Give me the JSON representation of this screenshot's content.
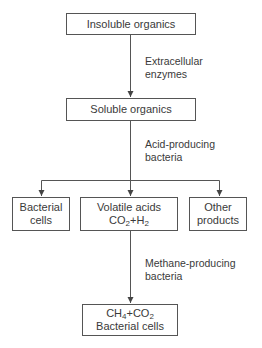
{
  "diagram": {
    "nodes": {
      "insoluble": {
        "label": "Insoluble organics"
      },
      "soluble": {
        "label": "Soluble organics"
      },
      "bacterial_cells": {
        "line1": "Bacterial",
        "line2": "cells"
      },
      "volatile": {
        "line1": "Volatile acids",
        "line2_a": "CO",
        "line2_sub_a": "2",
        "line2_b": "+H",
        "line2_sub_b": "2"
      },
      "other": {
        "line1": "Other",
        "line2": "products"
      },
      "final": {
        "line1_a": "CH",
        "line1_sub_a": "4",
        "line1_b": "+CO",
        "line1_sub_b": "2",
        "line2": "Bacterial cells"
      }
    },
    "edges": {
      "step1": {
        "line1": "Extracellular",
        "line2": "enzymes"
      },
      "step2": {
        "line1": "Acid-producing",
        "line2": "bacteria"
      },
      "step3": {
        "line1": "Methane-producing",
        "line2": "bacteria"
      }
    }
  }
}
